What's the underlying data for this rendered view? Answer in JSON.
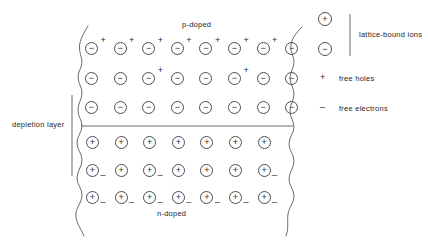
{
  "diagram": {
    "regions": {
      "p_label": "p-doped",
      "n_label": "n-doped"
    },
    "depletion": {
      "label": "depletion layer"
    },
    "symbols": {
      "positive_ion": "+",
      "negative_ion": "−",
      "free_hole": "+",
      "free_electron": "_"
    },
    "p_rows": [
      {
        "ion": "−",
        "count": 8,
        "holes": [
          0,
          1,
          2,
          3,
          4,
          5,
          6
        ]
      },
      {
        "ion": "−",
        "count": 8,
        "holes": [
          2,
          5
        ]
      },
      {
        "ion": "−",
        "count": 8,
        "holes": []
      }
    ],
    "n_rows": [
      {
        "ion": "+",
        "count": 7,
        "electrons": []
      },
      {
        "ion": "+",
        "count": 7,
        "electrons": [
          0,
          2,
          6
        ]
      },
      {
        "ion": "+",
        "count": 7,
        "electrons": [
          0,
          1,
          2,
          3,
          4,
          5,
          6
        ]
      }
    ],
    "legend": {
      "ion_positive": "+",
      "ion_negative": "−",
      "ion_label": "lattice-bound ions",
      "hole_symbol": "+",
      "hole_label": "free holes",
      "electron_symbol": "–",
      "electron_label": "free electrons"
    },
    "colors": {
      "stroke": "#4d4d4d",
      "text": "#1f1f1f",
      "background": "#ffffff"
    }
  }
}
